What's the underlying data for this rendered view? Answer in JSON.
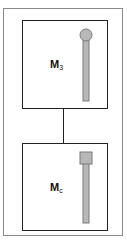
{
  "diagram": {
    "nodes": [
      {
        "id": "top-module",
        "label_main": "M",
        "label_sub": "3",
        "rod_head": "circle"
      },
      {
        "id": "bottom-module",
        "label_main": "M",
        "label_sub": "c",
        "rod_head": "square"
      }
    ],
    "edges": [
      {
        "from": "top-module",
        "to": "bottom-module"
      }
    ],
    "colors": {
      "box_border": "#222222",
      "frame_border": "#8a8a8a",
      "rod_fill": "#b8b8b8",
      "rod_stroke": "#7a7a7a"
    }
  }
}
